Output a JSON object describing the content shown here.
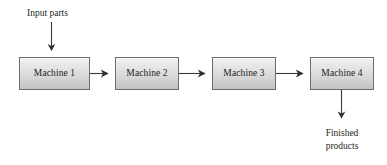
{
  "diagram": {
    "background_color": "#ffffff",
    "line_color": "#3a3a3a",
    "box_border_color": "#6d6d6d",
    "box_fill_top_color": "#f3f3f3",
    "box_fill_bottom_color": "#c2c2c2",
    "text_color": "#231f20",
    "nodes": [
      {
        "id": "machine-1",
        "label": "Machine 1"
      },
      {
        "id": "machine-2",
        "label": "Machine 2"
      },
      {
        "id": "machine-3",
        "label": "Machine 3"
      },
      {
        "id": "machine-4",
        "label": "Machine 4"
      }
    ],
    "annotations": {
      "input": "Input parts",
      "output_line_1": "Finished",
      "output_line_2": "products"
    },
    "arrows": [
      {
        "id": "input-arrow",
        "from": "Input parts",
        "to": "Machine 1",
        "direction": "down"
      },
      {
        "id": "arrow-1-2",
        "from": "Machine 1",
        "to": "Machine 2",
        "direction": "right"
      },
      {
        "id": "arrow-2-3",
        "from": "Machine 2",
        "to": "Machine 3",
        "direction": "right"
      },
      {
        "id": "arrow-3-4",
        "from": "Machine 3",
        "to": "Machine 4",
        "direction": "right"
      },
      {
        "id": "output-arrow",
        "from": "Machine 4",
        "to": "Finished products",
        "direction": "down"
      }
    ]
  }
}
